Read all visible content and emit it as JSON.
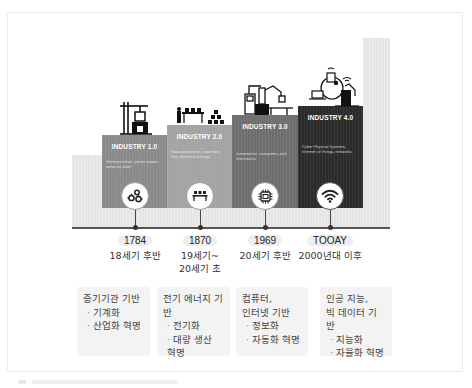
{
  "diagram": {
    "stages": [
      {
        "id": "1",
        "label": "INDUSTRY 1.0",
        "description": "Mechanization, steam power, weaving loom",
        "color": "#8a8a8a",
        "icon": "gears-icon",
        "illustration": "steam-crane-illustration",
        "year": "1784",
        "era": "18세기 후반",
        "basis": "증기기관 기반",
        "bullets": [
          "기계화",
          "산업화 혁명"
        ]
      },
      {
        "id": "2",
        "label": "INDUSTRY 2.0",
        "description": "Mass production, assembly line, electrical energy",
        "color": "#a3a3a3",
        "icon": "assembly-line-icon",
        "illustration": "assembly-line-illustration",
        "year": "1870",
        "era": "19세기~ 20세기 초",
        "era_lines": [
          "19세기~",
          "20세기 초"
        ],
        "basis": "전기 에너지 기반",
        "bullets": [
          "전기화",
          "대량 생산 혁명"
        ]
      },
      {
        "id": "3",
        "label": "INDUSTRY 3.0",
        "description": "Automation, computers and electronics",
        "color": "#6e6e6e",
        "icon": "microchip-icon",
        "illustration": "robot-arm-illustration",
        "year": "1969",
        "era": "20세기 후반",
        "basis_lines": [
          "컴퓨터,",
          "인터넷 기반"
        ],
        "bullets": [
          "정보화",
          "자동화 혁명"
        ]
      },
      {
        "id": "4",
        "label": "INDUSTRY 4.0",
        "description": "Cyber Physical Systems, internet of things, networks",
        "color": "#2b2b2b",
        "icon": "wifi-icon",
        "illustration": "iot-network-illustration",
        "year": "TOOAY",
        "era": "2000년대 이후",
        "basis_lines": [
          "인공 지능,",
          "빅 데이터 기반"
        ],
        "bullets": [
          "지능화",
          "자율화 혁명"
        ]
      }
    ]
  }
}
